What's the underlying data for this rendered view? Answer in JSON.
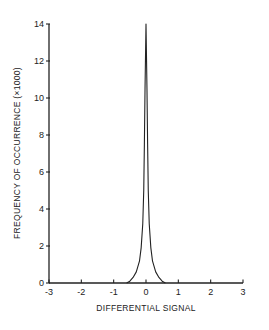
{
  "chart_data": {
    "type": "line",
    "title": "",
    "xlabel": "DIFFERENTIAL SIGNAL",
    "ylabel": "FREQUENCY OF OCCURRENCE (×1000)",
    "xlim": [
      -3,
      3
    ],
    "ylim": [
      0,
      14
    ],
    "xticks": [
      -3,
      -2,
      -1,
      0,
      1,
      2,
      3
    ],
    "yticks": [
      0,
      2,
      4,
      6,
      8,
      10,
      12,
      14
    ],
    "grid": false,
    "legend": null,
    "series": [
      {
        "name": "distribution",
        "x": [
          -0.6,
          -0.5,
          -0.4,
          -0.3,
          -0.2,
          -0.15,
          -0.1,
          -0.07,
          -0.05,
          -0.03,
          0,
          0.03,
          0.05,
          0.07,
          0.1,
          0.15,
          0.2,
          0.3,
          0.4,
          0.5,
          0.6
        ],
        "y": [
          0,
          0.1,
          0.3,
          0.6,
          1.2,
          1.9,
          3.2,
          5.0,
          7.5,
          10.5,
          14,
          10.5,
          7.5,
          5.0,
          3.2,
          1.9,
          1.2,
          0.6,
          0.3,
          0.1,
          0
        ]
      }
    ]
  },
  "axes": {
    "xlabel": "DIFFERENTIAL SIGNAL",
    "ylabel": "FREQUENCY OF OCCURRENCE (×1000)",
    "xtick_labels": [
      "-3",
      "-2",
      "-1",
      "0",
      "1",
      "2",
      "3"
    ],
    "ytick_labels": [
      "0",
      "2",
      "4",
      "6",
      "8",
      "10",
      "12",
      "14"
    ]
  }
}
